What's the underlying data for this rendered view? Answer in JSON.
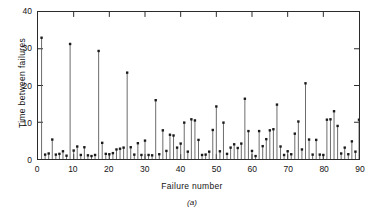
{
  "figure": {
    "caption": "(a)",
    "y_axis_title": "Time between failures",
    "x_axis_title": "Failure number"
  },
  "chart_data": {
    "type": "bar",
    "title": "",
    "subtitle": "",
    "caption": "(a)",
    "xlabel": "Failure number",
    "ylabel": "Time between failures",
    "xlim": [
      0,
      90
    ],
    "ylim": [
      0,
      40
    ],
    "xticks": [
      0,
      10,
      20,
      30,
      40,
      50,
      60,
      70,
      80,
      90
    ],
    "yticks": [
      0,
      10,
      20,
      30,
      40
    ],
    "xtick_labels": [
      "0",
      "10",
      "20",
      "30",
      "40",
      "50",
      "60",
      "70",
      "80",
      "90"
    ],
    "ytick_labels": [
      "0",
      "10",
      "20",
      "30",
      "40"
    ],
    "grid": false,
    "legend": null,
    "style": "stem-plot with square markers, ticks inward on all four sides",
    "series_name": "Time between failures",
    "marker": "filled-square",
    "line_color": "#5a5a5a",
    "marker_color": "#1a1a1a",
    "x": [
      1,
      2,
      3,
      4,
      5,
      6,
      7,
      8,
      9,
      10,
      11,
      12,
      13,
      14,
      15,
      16,
      17,
      18,
      19,
      20,
      21,
      22,
      23,
      24,
      25,
      26,
      27,
      28,
      29,
      30,
      31,
      32,
      33,
      34,
      35,
      36,
      37,
      38,
      39,
      40,
      41,
      42,
      43,
      44,
      45,
      46,
      47,
      48,
      49,
      50,
      51,
      52,
      53,
      54,
      55,
      56,
      57,
      58,
      59,
      60,
      61,
      62,
      63,
      64,
      65,
      66,
      67,
      68,
      69,
      70,
      71,
      72,
      73,
      74,
      75,
      76,
      77,
      78,
      79,
      80,
      81,
      82,
      83,
      84,
      85,
      86,
      87,
      88,
      89,
      90
    ],
    "values": [
      33,
      1.2,
      1.5,
      5.3,
      1.2,
      1.4,
      2.1,
      0.9,
      31.3,
      2.3,
      3.4,
      1.1,
      3.2,
      1.0,
      0.8,
      1.1,
      29.4,
      4.4,
      1.4,
      1.3,
      1.6,
      2.6,
      2.8,
      3.1,
      23.5,
      3.2,
      1.2,
      4.3,
      1.1,
      5.0,
      1.1,
      1.0,
      16.0,
      1.3,
      7.8,
      2.2,
      6.6,
      6.4,
      3.1,
      4.2,
      9.9,
      2.0,
      10.8,
      10.5,
      5.2,
      1.1,
      1.2,
      2.0,
      7.9,
      14.3,
      2.1,
      9.9,
      1.4,
      3.1,
      4.0,
      3.0,
      4.2,
      16.4,
      7.6,
      2.2,
      0.8,
      7.6,
      3.5,
      5.4,
      7.8,
      8.1,
      14.8,
      3.4,
      1.1,
      2.1,
      1.3,
      6.9,
      10.2,
      2.6,
      20.6,
      5.3,
      1.2,
      5.2,
      1.2,
      1.1,
      10.7,
      10.8,
      13.0,
      9.0,
      1.5,
      3.1,
      1.3,
      4.8,
      2.0,
      10.7
    ]
  }
}
